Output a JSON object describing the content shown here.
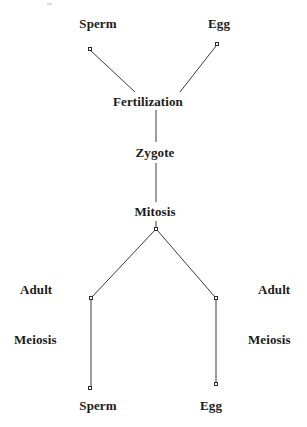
{
  "diagram": {
    "type": "life-cycle-flow-diagram",
    "background_color": "#ffffff",
    "line_color": "#3a3a3a",
    "text_color": "#1b1b1b",
    "nodes": [
      {
        "id": "sperm_top",
        "label": "Sperm",
        "label_x": 98,
        "label_y": 17,
        "dot_x": 90,
        "dot_y": 49
      },
      {
        "id": "egg_top",
        "label": "Egg",
        "label_x": 219,
        "label_y": 17,
        "dot_x": 217,
        "dot_y": 44
      },
      {
        "id": "fertilization",
        "label": "Fertilization",
        "label_x": 148,
        "label_y": 95,
        "dot_x": null,
        "dot_y": null
      },
      {
        "id": "zygote",
        "label": "Zygote",
        "label_x": 155,
        "label_y": 146,
        "dot_x": null,
        "dot_y": null
      },
      {
        "id": "mitosis",
        "label": "Mitosis",
        "label_x": 155,
        "label_y": 205,
        "dot_x": null,
        "dot_y": null
      },
      {
        "id": "branch",
        "label": "",
        "label_x": null,
        "label_y": null,
        "dot_x": 156,
        "dot_y": 229
      },
      {
        "id": "adult_left",
        "label": "Adult",
        "label_x": 20,
        "label_y": 283,
        "dot_x": 91,
        "dot_y": 298
      },
      {
        "id": "adult_right",
        "label": "Adult",
        "label_x": 258,
        "label_y": 283,
        "dot_x": 216,
        "dot_y": 298
      },
      {
        "id": "meiosis_left",
        "label": "Meiosis",
        "label_x": 14,
        "label_y": 333,
        "dot_x": null,
        "dot_y": null
      },
      {
        "id": "meiosis_right",
        "label": "Meiosis",
        "label_x": 248,
        "label_y": 333,
        "dot_x": null,
        "dot_y": null
      },
      {
        "id": "sperm_bottom",
        "label": "Sperm",
        "label_x": 98,
        "label_y": 399,
        "dot_x": 90,
        "dot_y": 388
      },
      {
        "id": "egg_bottom",
        "label": "Egg",
        "label_x": 211,
        "label_y": 399,
        "dot_x": 216,
        "dot_y": 384
      }
    ],
    "edges": [
      {
        "from": "sperm_top",
        "to": "fertilization",
        "x1": 90,
        "y1": 50,
        "x2": 135,
        "y2": 92
      },
      {
        "from": "egg_top",
        "to": "fertilization",
        "x1": 216,
        "y1": 46,
        "x2": 180,
        "y2": 92
      },
      {
        "from": "fertilization",
        "to": "zygote",
        "x1": 156,
        "y1": 110,
        "x2": 156,
        "y2": 142
      },
      {
        "from": "zygote",
        "to": "mitosis",
        "x1": 156,
        "y1": 163,
        "x2": 156,
        "y2": 202
      },
      {
        "from": "mitosis",
        "to": "branch",
        "x1": 156,
        "y1": 221,
        "x2": 156,
        "y2": 227
      },
      {
        "from": "branch",
        "to": "adult_left",
        "x1": 155,
        "y1": 230,
        "x2": 92,
        "y2": 297
      },
      {
        "from": "branch",
        "to": "adult_right",
        "x1": 157,
        "y1": 230,
        "x2": 215,
        "y2": 297
      },
      {
        "from": "adult_left",
        "to": "sperm_bottom",
        "x1": 91,
        "y1": 300,
        "x2": 91,
        "y2": 387
      },
      {
        "from": "adult_right",
        "to": "egg_bottom",
        "x1": 216,
        "y1": 300,
        "x2": 216,
        "y2": 383
      }
    ],
    "artifacts": [
      {
        "id": "top-speck",
        "x": 47,
        "y": 3
      }
    ]
  }
}
